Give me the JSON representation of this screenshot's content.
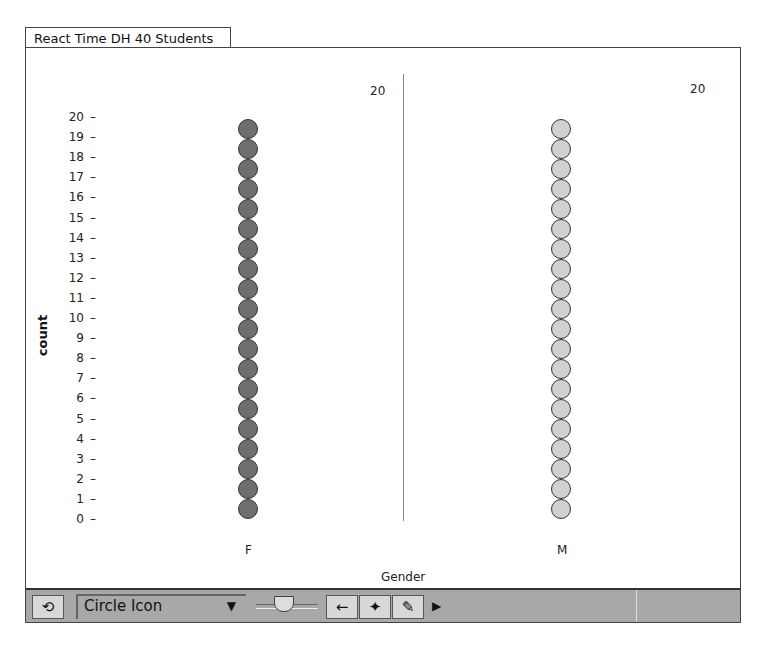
{
  "window": {
    "tab_title": "React Time DH 40 Students"
  },
  "chart_data": {
    "type": "bar",
    "subtype": "dot-stack",
    "title": "React Time DH 40 Students",
    "xlabel": "Gender",
    "ylabel": "count",
    "categories": [
      "F",
      "M"
    ],
    "values": [
      20,
      20
    ],
    "ylim": [
      0,
      20
    ],
    "yticks": [
      "20",
      "19",
      "18",
      "17",
      "16",
      "15",
      "14",
      "13",
      "12",
      "11",
      "10",
      "9",
      "8",
      "7",
      "6",
      "5",
      "4",
      "3",
      "2",
      "1",
      "0"
    ],
    "colors": {
      "F": "#6e6e6e",
      "M": "#d0d0d0"
    },
    "group_counts": [
      "20",
      "20"
    ],
    "grid": false
  },
  "toolbar": {
    "refresh_icon": "rotate-arrows-icon",
    "icon_select_value": "Circle Icon",
    "dropdown_icon": "triangle-down-icon",
    "buttons": [
      {
        "name": "back-arrow-icon",
        "glyph": "←"
      },
      {
        "name": "crosshair-icon",
        "glyph": "✦"
      },
      {
        "name": "pencil-icon",
        "glyph": "✎"
      }
    ],
    "more_glyph": "▶",
    "refresh_glyph": "⟲"
  }
}
